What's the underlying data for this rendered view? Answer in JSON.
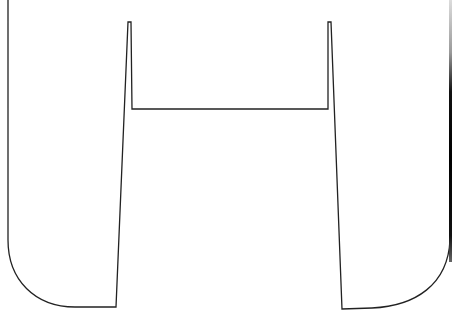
{
  "figure": {
    "stroke_color": "#222222",
    "fill_color": "#ffffff",
    "background": "#ffffff"
  }
}
